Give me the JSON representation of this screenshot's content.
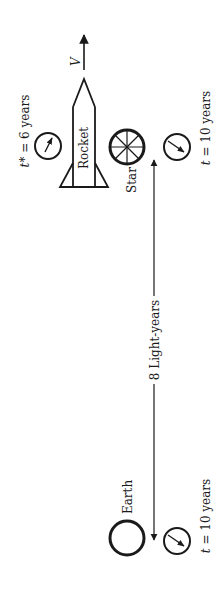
{
  "diagram": {
    "velocity_label": "V",
    "rocket_label": "Rocket",
    "star_label": "Star",
    "earth_label": "Earth",
    "distance_label": "8 Light-years",
    "rocket_clock": {
      "symbol": "t*",
      "equals": " = 6 years"
    },
    "star_clock": {
      "symbol": "t",
      "equals": " = 10 years"
    },
    "earth_clock": {
      "symbol": "t",
      "equals": " = 10 years"
    }
  },
  "colors": {
    "ink": "#1a1a1a",
    "background": "#ffffff"
  }
}
